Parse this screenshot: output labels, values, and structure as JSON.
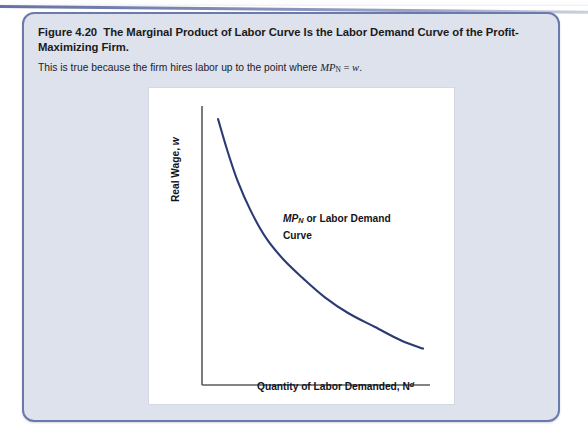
{
  "figure": {
    "number": "Figure 4.20",
    "title": "The Marginal Product of Labor Curve Is the Labor Demand Curve of the Profit-Maximizing Firm.",
    "title_line1": "The Marginal Product of Labor Curve Is the Labor Demand Curve of the Profit-",
    "title_line2": "Maximizing Firm.",
    "subtitle_prefix": "This is true because the firm hires labor up to the point where ",
    "subtitle_math_var": "MP",
    "subtitle_math_sub": "N",
    "subtitle_math_rest": " = w.",
    "border_color": "#6b7aad",
    "background_color": "#dde2ec"
  },
  "chart_data": {
    "type": "line",
    "title": "",
    "xlabel": "Quantity of Labor Demanded, N",
    "xlabel_sup": "d",
    "ylabel": "Real Wage, w",
    "ylabel_var": "w",
    "ylabel_prefix": "Real Wage, ",
    "series": [
      {
        "name": "MP_N or Labor Demand Curve",
        "color": "#2b3a74",
        "x": [
          0.06,
          0.1,
          0.15,
          0.21,
          0.28,
          0.36,
          0.45,
          0.55,
          0.66,
          0.78,
          0.9,
          1.0
        ],
        "y": [
          0.97,
          0.86,
          0.74,
          0.63,
          0.53,
          0.45,
          0.38,
          0.31,
          0.25,
          0.2,
          0.15,
          0.12
        ]
      }
    ],
    "annotation_line1_var": "MP",
    "annotation_line1_sub": "N",
    "annotation_line1_rest": " or Labor Demand",
    "annotation_line2": "Curve",
    "grid": false,
    "legend": "none",
    "axis_color": "#55555d",
    "xlim": [
      0,
      1
    ],
    "ylim": [
      0,
      1
    ]
  }
}
